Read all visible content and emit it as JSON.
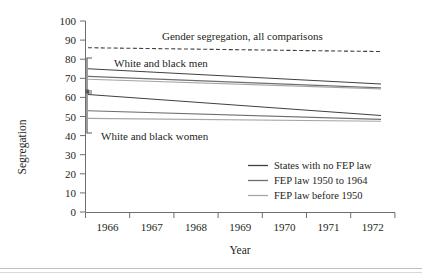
{
  "figure": {
    "background": "#ffffff",
    "axis_color": "#6d6e71",
    "text_color": "#231f20"
  },
  "chart_data": {
    "type": "line",
    "title": "",
    "xlabel": "Year",
    "ylabel": "Segregation",
    "x": [
      1966,
      1972
    ],
    "xlim": [
      1965.6,
      1972.4
    ],
    "ylim": [
      0,
      100
    ],
    "xticklabels": [
      "1966",
      "1967",
      "1968",
      "1969",
      "1970",
      "1971",
      "1972"
    ],
    "yticklabels": [
      "0",
      "10",
      "20",
      "30",
      "40",
      "50",
      "60",
      "70",
      "80",
      "90",
      "100"
    ],
    "ytick_step": 10,
    "grid": false,
    "legend_position": "lower right",
    "series": [
      {
        "name": "Gender segregation, all comparisons",
        "group": "gender",
        "style": "dashed",
        "color": "#404040",
        "values": [
          86,
          84
        ]
      },
      {
        "name": "States with no FEP law",
        "group": "White and black men",
        "style": "solid",
        "color": "#404040",
        "values": [
          75,
          67
        ]
      },
      {
        "name": "FEP law 1950 to 1964",
        "group": "White and black men",
        "style": "solid",
        "color": "#6e6e6e",
        "values": [
          71,
          65
        ]
      },
      {
        "name": "FEP law before 1950",
        "group": "White and black men",
        "style": "solid",
        "color": "#a6a6a6",
        "values": [
          69.5,
          64.5
        ]
      },
      {
        "name": "States with no FEP law",
        "group": "White and black women",
        "style": "solid",
        "color": "#404040",
        "values": [
          61.5,
          50.5
        ]
      },
      {
        "name": "FEP law 1950 to 1964",
        "group": "White and black women",
        "style": "solid",
        "color": "#6e6e6e",
        "values": [
          53,
          48.5
        ]
      },
      {
        "name": "FEP law before 1950",
        "group": "White and black women",
        "style": "solid",
        "color": "#a6a6a6",
        "values": [
          49,
          47.5
        ]
      }
    ],
    "annotations": [
      {
        "id": "gender",
        "text": "Gender segregation, all comparisons"
      },
      {
        "id": "men",
        "text": "White and black men"
      },
      {
        "id": "women",
        "text": "White and black women"
      }
    ],
    "legend": [
      {
        "label": "States with no FEP law",
        "color": "#404040"
      },
      {
        "label": "FEP law 1950 to 1964",
        "color": "#6e6e6e"
      },
      {
        "label": "FEP law before 1950",
        "color": "#a6a6a6"
      }
    ]
  }
}
